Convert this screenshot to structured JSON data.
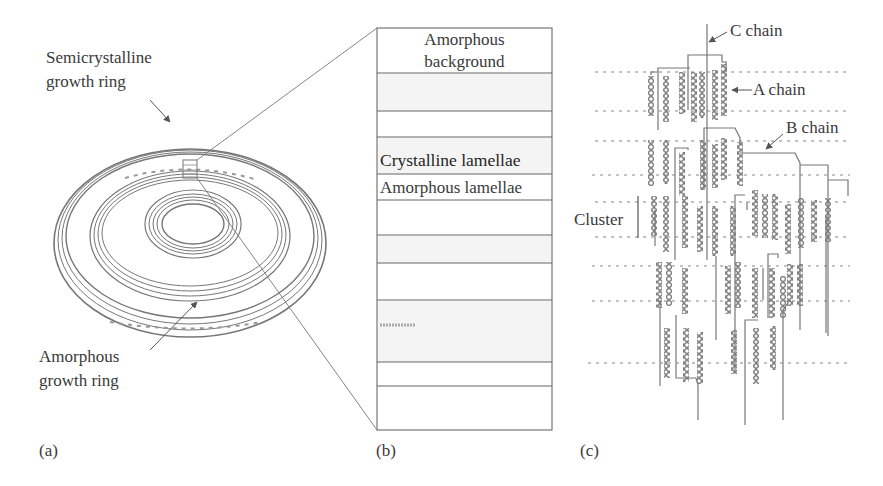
{
  "figure": {
    "panels": [
      {
        "id": "a",
        "label": "(a)",
        "annotations": {
          "semicrystalline_line1": "Semicrystalline",
          "semicrystalline_line2": "growth ring",
          "amorphous_line1": "Amorphous",
          "amorphous_line2": "growth ring"
        }
      },
      {
        "id": "b",
        "label": "(b)",
        "annotations": {
          "background_line1": "Amorphous",
          "background_line2": "background",
          "crystalline": "Crystalline lamellae",
          "amorphous": "Amorphous lamellae"
        }
      },
      {
        "id": "c",
        "label": "(c)",
        "annotations": {
          "c_chain": "C chain",
          "a_chain": "A chain",
          "b_chain": "B chain",
          "cluster": "Cluster"
        }
      }
    ],
    "colors": {
      "line": "#6e6e6e",
      "bead": "#7a7a7a",
      "text": "#3a3a3a"
    }
  }
}
